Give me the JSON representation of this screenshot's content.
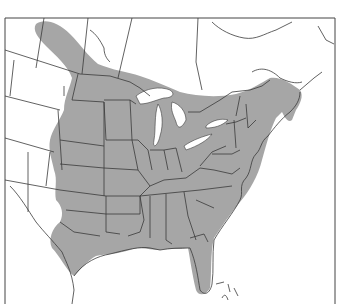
{
  "map": {
    "type": "species range map",
    "region": "Eastern North America",
    "frame": {
      "left": 5,
      "top": 18,
      "right": 335,
      "bottom": 304
    },
    "colors": {
      "background": "#ffffff",
      "range_fill": "#a6a6a6",
      "borders": "#3a3a3a",
      "water": "#ffffff"
    },
    "legend": null,
    "labels": []
  }
}
